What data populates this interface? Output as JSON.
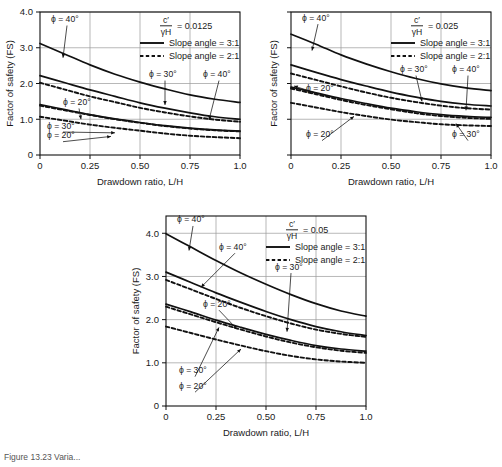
{
  "figure": {
    "caption_fragment": "Figure  13.23   Varia..."
  },
  "common": {
    "ylabel": "Factor of safety (FS)",
    "xlabel": "Drawdown ratio, L/H",
    "xticks": [
      "0",
      "0.25",
      "0.50",
      "0.75",
      "1.0"
    ],
    "yticks": [
      "0",
      "1.0",
      "2.0",
      "3.0",
      "4.0"
    ],
    "legend": {
      "solid_label": "Slope angle = 3:1",
      "dashed_label": "Slope angle = 2:1"
    },
    "ratio_numerator": "c′",
    "ratio_denominator": "γH",
    "equals": "="
  },
  "chart_data": [
    {
      "id": "chart-a",
      "type": "line",
      "title": "c′/γH = 0.0125",
      "ratio_value": "0.0125",
      "xlabel": "Drawdown ratio, L/H",
      "ylabel": "Factor of safety (FS)",
      "xlim": [
        0,
        1.0
      ],
      "ylim": [
        0,
        4.0
      ],
      "xticks": [
        0,
        0.25,
        0.5,
        0.75,
        1.0
      ],
      "yticks": [
        0,
        1.0,
        2.0,
        3.0,
        4.0
      ],
      "grid": true,
      "show_ytick_labels": true,
      "legend_position": "top-right",
      "annotations": [
        {
          "text": "ϕ = 40°",
          "x": 0.055,
          "y": 3.72,
          "target_x": 0.115,
          "target_y": 2.72,
          "arrow": true
        },
        {
          "text": "ϕ = 30°",
          "x": 0.545,
          "y": 2.18,
          "target_x": 0.625,
          "target_y": 1.4,
          "arrow": true
        },
        {
          "text": "ϕ = 40°",
          "x": 0.815,
          "y": 2.18,
          "target_x": 0.845,
          "target_y": 0.98,
          "arrow": true
        },
        {
          "text": "ϕ = 20°",
          "x": 0.115,
          "y": 1.4,
          "target_x": 0.205,
          "target_y": 1.0,
          "arrow": true
        },
        {
          "text": "ϕ = 30°",
          "x": 0.035,
          "y": 0.74,
          "target_x": 0.375,
          "target_y": 0.62,
          "arrow": true
        },
        {
          "text": "ϕ = 20°",
          "x": 0.035,
          "y": 0.47,
          "target_x": 0.355,
          "target_y": 0.52,
          "arrow": true
        }
      ],
      "series": [
        {
          "name": "ϕ = 40°, 3:1",
          "style": "solid",
          "x": [
            0,
            0.125,
            0.25,
            0.375,
            0.5,
            0.625,
            0.75,
            0.875,
            1.0
          ],
          "y": [
            3.12,
            2.82,
            2.52,
            2.26,
            2.04,
            1.85,
            1.68,
            1.56,
            1.47
          ]
        },
        {
          "name": "ϕ = 30°, 3:1",
          "style": "solid",
          "x": [
            0,
            0.125,
            0.25,
            0.375,
            0.5,
            0.625,
            0.75,
            0.875,
            1.0
          ],
          "y": [
            2.22,
            2.02,
            1.82,
            1.64,
            1.46,
            1.31,
            1.18,
            1.07,
            1.0
          ]
        },
        {
          "name": "ϕ = 40°, 2:1",
          "style": "dashed",
          "x": [
            0,
            0.125,
            0.25,
            0.375,
            0.5,
            0.625,
            0.75,
            0.875,
            1.0
          ],
          "y": [
            2.02,
            1.83,
            1.64,
            1.48,
            1.32,
            1.19,
            1.08,
            0.99,
            0.93
          ]
        },
        {
          "name": "ϕ = 20°, 3:1",
          "style": "solid",
          "x": [
            0,
            0.125,
            0.25,
            0.375,
            0.5,
            0.625,
            0.75,
            0.875,
            1.0
          ],
          "y": [
            1.41,
            1.27,
            1.13,
            1.01,
            0.91,
            0.82,
            0.75,
            0.7,
            0.67
          ]
        },
        {
          "name": "ϕ = 30°, 2:1",
          "style": "dashed",
          "x": [
            0,
            0.125,
            0.25,
            0.375,
            0.5,
            0.625,
            0.75,
            0.875,
            1.0
          ],
          "y": [
            1.38,
            1.25,
            1.12,
            1.0,
            0.9,
            0.81,
            0.74,
            0.69,
            0.66
          ]
        },
        {
          "name": "ϕ = 20°, 2:1",
          "style": "dashed",
          "x": [
            0,
            0.125,
            0.25,
            0.375,
            0.5,
            0.625,
            0.75,
            0.875,
            1.0
          ],
          "y": [
            1.07,
            0.96,
            0.85,
            0.76,
            0.68,
            0.6,
            0.54,
            0.5,
            0.47
          ]
        }
      ]
    },
    {
      "id": "chart-b",
      "type": "line",
      "title": "c′/γH = 0.025",
      "ratio_value": "0.025",
      "xlabel": "Drawdown ratio, L/H",
      "ylabel": "Factor of safety (FS)",
      "xlim": [
        0,
        1.0
      ],
      "ylim": [
        0,
        4.0
      ],
      "xticks": [
        0,
        0.25,
        0.5,
        0.75,
        1.0
      ],
      "yticks": [
        0,
        1.0,
        2.0,
        3.0,
        4.0
      ],
      "grid": true,
      "show_ytick_labels": false,
      "legend_position": "top-right",
      "annotations": [
        {
          "text": "ϕ = 40°",
          "x": 0.055,
          "y": 3.76,
          "target_x": 0.105,
          "target_y": 2.92,
          "arrow": true
        },
        {
          "text": "ϕ = 30°",
          "x": 0.545,
          "y": 2.32,
          "target_x": 0.655,
          "target_y": 1.5,
          "arrow": true
        },
        {
          "text": "ϕ = 40°",
          "x": 0.805,
          "y": 2.32,
          "target_x": 0.875,
          "target_y": 1.25,
          "arrow": true
        },
        {
          "text": "ϕ = 20°",
          "x": 0.075,
          "y": 1.78,
          "target_x": 0.015,
          "target_y": 1.93,
          "arrow": true
        },
        {
          "text": "ϕ = 20°",
          "x": 0.075,
          "y": 0.5,
          "target_x": 0.315,
          "target_y": 1.08,
          "arrow": true
        },
        {
          "text": "ϕ = 30°",
          "x": 0.805,
          "y": 0.5,
          "target_x": 0.825,
          "target_y": 0.88,
          "arrow": true
        }
      ],
      "series": [
        {
          "name": "ϕ = 40°, 3:1",
          "style": "solid",
          "x": [
            0,
            0.125,
            0.25,
            0.375,
            0.5,
            0.625,
            0.75,
            0.875,
            1.0
          ],
          "y": [
            3.38,
            3.1,
            2.8,
            2.55,
            2.33,
            2.14,
            1.99,
            1.88,
            1.8
          ]
        },
        {
          "name": "ϕ = 30°, 3:1",
          "style": "solid",
          "x": [
            0,
            0.125,
            0.25,
            0.375,
            0.5,
            0.625,
            0.75,
            0.875,
            1.0
          ],
          "y": [
            2.52,
            2.31,
            2.11,
            1.93,
            1.76,
            1.62,
            1.5,
            1.42,
            1.37
          ]
        },
        {
          "name": "ϕ = 40°, 2:1",
          "style": "dashed",
          "x": [
            0,
            0.125,
            0.25,
            0.375,
            0.5,
            0.625,
            0.75,
            0.875,
            1.0
          ],
          "y": [
            2.28,
            2.1,
            1.92,
            1.75,
            1.6,
            1.48,
            1.38,
            1.31,
            1.27
          ]
        },
        {
          "name": "ϕ = 20°, 3:1",
          "style": "solid",
          "x": [
            0,
            0.125,
            0.25,
            0.375,
            0.5,
            0.625,
            0.75,
            0.875,
            1.0
          ],
          "y": [
            1.9,
            1.74,
            1.58,
            1.44,
            1.31,
            1.21,
            1.13,
            1.08,
            1.05
          ]
        },
        {
          "name": "ϕ = 30°, 2:1",
          "style": "dashed",
          "x": [
            0,
            0.125,
            0.25,
            0.375,
            0.5,
            0.625,
            0.75,
            0.875,
            1.0
          ],
          "y": [
            1.86,
            1.7,
            1.54,
            1.4,
            1.28,
            1.17,
            1.09,
            1.04,
            1.01
          ]
        },
        {
          "name": "ϕ = 20°, 2:1",
          "style": "dashed",
          "x": [
            0,
            0.125,
            0.25,
            0.375,
            0.5,
            0.625,
            0.75,
            0.875,
            1.0
          ],
          "y": [
            1.46,
            1.33,
            1.2,
            1.09,
            0.99,
            0.92,
            0.86,
            0.83,
            0.81
          ]
        }
      ]
    },
    {
      "id": "chart-c",
      "type": "line",
      "title": "c′/γH = 0.05",
      "ratio_value": "0.05",
      "xlabel": "Drawdown ratio, L/H",
      "ylabel": "Factor of safety (FS)",
      "xlim": [
        0,
        1.0
      ],
      "ylim": [
        0,
        4.4
      ],
      "xticks": [
        0,
        0.25,
        0.5,
        0.75,
        1.0
      ],
      "yticks": [
        0,
        1.0,
        2.0,
        3.0,
        4.0
      ],
      "grid": true,
      "show_ytick_labels": true,
      "legend_position": "top-right",
      "annotations": [
        {
          "text": "ϕ = 40°",
          "x": 0.055,
          "y": 4.25,
          "target_x": 0.115,
          "target_y": 3.6,
          "arrow": true
        },
        {
          "text": "ϕ = 40°",
          "x": 0.265,
          "y": 3.62,
          "target_x": 0.175,
          "target_y": 2.75,
          "arrow": true
        },
        {
          "text": "ϕ = 30°",
          "x": 0.545,
          "y": 3.16,
          "target_x": 0.605,
          "target_y": 1.72,
          "arrow": true
        },
        {
          "text": "ϕ = 20°",
          "x": 0.185,
          "y": 2.3,
          "target_x": 0.355,
          "target_y": 1.78,
          "arrow": true
        },
        {
          "text": "ϕ = 30°",
          "x": 0.065,
          "y": 0.76,
          "target_x": 0.265,
          "target_y": 1.82,
          "arrow": true
        },
        {
          "text": "ϕ = 20°",
          "x": 0.065,
          "y": 0.4,
          "target_x": 0.375,
          "target_y": 1.32,
          "arrow": true
        }
      ],
      "series": [
        {
          "name": "ϕ = 40°, 3:1",
          "style": "solid",
          "x": [
            0,
            0.125,
            0.25,
            0.375,
            0.5,
            0.625,
            0.75,
            0.875,
            1.0
          ],
          "y": [
            3.99,
            3.68,
            3.37,
            3.08,
            2.82,
            2.58,
            2.37,
            2.2,
            2.08
          ]
        },
        {
          "name": "ϕ = 30°, 3:1",
          "style": "solid",
          "x": [
            0,
            0.125,
            0.25,
            0.375,
            0.5,
            0.625,
            0.75,
            0.875,
            1.0
          ],
          "y": [
            3.1,
            2.86,
            2.62,
            2.4,
            2.19,
            2.0,
            1.84,
            1.72,
            1.63
          ]
        },
        {
          "name": "ϕ = 40°, 2:1",
          "style": "dashed",
          "x": [
            0,
            0.125,
            0.25,
            0.375,
            0.5,
            0.625,
            0.75,
            0.875,
            1.0
          ],
          "y": [
            2.92,
            2.7,
            2.48,
            2.27,
            2.08,
            1.91,
            1.77,
            1.67,
            1.6
          ]
        },
        {
          "name": "ϕ = 20°, 3:1",
          "style": "solid",
          "x": [
            0,
            0.125,
            0.25,
            0.375,
            0.5,
            0.625,
            0.75,
            0.875,
            1.0
          ],
          "y": [
            2.36,
            2.18,
            1.99,
            1.82,
            1.66,
            1.52,
            1.4,
            1.32,
            1.27
          ]
        },
        {
          "name": "ϕ = 30°, 2:1",
          "style": "dashed",
          "x": [
            0,
            0.125,
            0.25,
            0.375,
            0.5,
            0.625,
            0.75,
            0.875,
            1.0
          ],
          "y": [
            2.3,
            2.12,
            1.94,
            1.77,
            1.61,
            1.47,
            1.36,
            1.28,
            1.23
          ]
        },
        {
          "name": "ϕ = 20°, 2:1",
          "style": "dashed",
          "x": [
            0,
            0.125,
            0.25,
            0.375,
            0.5,
            0.625,
            0.75,
            0.875,
            1.0
          ],
          "y": [
            1.84,
            1.69,
            1.54,
            1.4,
            1.27,
            1.16,
            1.08,
            1.03,
            1.0
          ]
        }
      ]
    }
  ]
}
